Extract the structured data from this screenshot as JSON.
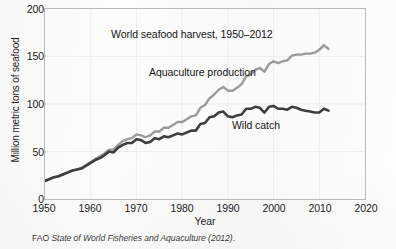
{
  "figure": {
    "title": "World seafood harvest, 1950–2012",
    "caption_prefix": "FAO ",
    "caption_italic": "State of World Fisheries and Aquaculture (2012)",
    "caption_suffix": "."
  },
  "axes": {
    "xlabel": "Year",
    "ylabel": "Million metric tons of seafood",
    "xticks": [
      "1950",
      "1960",
      "1970",
      "1980",
      "1990",
      "2000",
      "2010",
      "2020"
    ],
    "yticks": [
      "0",
      "50",
      "100",
      "150",
      "200"
    ]
  },
  "annotations": {
    "aquaculture": "Aquaculture production",
    "wild_catch": "Wild catch"
  },
  "colors": {
    "aquaculture_line": "#9a9a9a",
    "wild_catch_line": "#3d3d3d",
    "frame": "#b9b9b9",
    "grid": "#ececec",
    "page": "#fdfdfc",
    "text": "#1c1c1c"
  },
  "chart_data": {
    "type": "line",
    "title": "World seafood harvest, 1950–2012",
    "xlabel": "Year",
    "ylabel": "Million metric tons of seafood",
    "xlim": [
      1950,
      2020
    ],
    "ylim": [
      0,
      200
    ],
    "xticks": [
      1950,
      1960,
      1970,
      1980,
      1990,
      2000,
      2010,
      2020
    ],
    "yticks": [
      0,
      50,
      100,
      150,
      200
    ],
    "grid": true,
    "legend": "inline-annotations",
    "units": "million metric tons",
    "x": [
      1950,
      1951,
      1952,
      1953,
      1954,
      1955,
      1956,
      1957,
      1958,
      1959,
      1960,
      1961,
      1962,
      1963,
      1964,
      1965,
      1966,
      1967,
      1968,
      1969,
      1970,
      1971,
      1972,
      1973,
      1974,
      1975,
      1976,
      1977,
      1978,
      1979,
      1980,
      1981,
      1982,
      1983,
      1984,
      1985,
      1986,
      1987,
      1988,
      1989,
      1990,
      1991,
      1992,
      1993,
      1994,
      1995,
      1996,
      1997,
      1998,
      1999,
      2000,
      2001,
      2002,
      2003,
      2004,
      2005,
      2006,
      2007,
      2008,
      2009,
      2010,
      2011,
      2012
    ],
    "series": [
      {
        "name": "Wild catch",
        "color": "#3d3d3d",
        "values": [
          19,
          21,
          23,
          24,
          26,
          28,
          30,
          31,
          32,
          35,
          38,
          41,
          43,
          46,
          50,
          49,
          54,
          57,
          59,
          59,
          63,
          62,
          59,
          60,
          64,
          63,
          66,
          65,
          67,
          69,
          68,
          70,
          72,
          72,
          79,
          80,
          86,
          87,
          91,
          92,
          87,
          86,
          88,
          89,
          95,
          95,
          97,
          96,
          91,
          97,
          98,
          95,
          95,
          94,
          97,
          96,
          94,
          93,
          92,
          91,
          91,
          95,
          93
        ]
      },
      {
        "name": "Aquaculture production",
        "color": "#9a9a9a",
        "values": [
          19,
          21,
          23,
          24,
          26,
          28,
          30,
          31,
          33,
          36,
          39,
          42,
          45,
          48,
          52,
          52,
          57,
          61,
          63,
          64,
          68,
          67,
          65,
          67,
          71,
          71,
          75,
          75,
          78,
          81,
          81,
          84,
          87,
          88,
          96,
          99,
          106,
          110,
          115,
          118,
          114,
          114,
          117,
          121,
          129,
          131,
          136,
          138,
          134,
          142,
          145,
          143,
          145,
          146,
          151,
          152,
          152,
          153,
          153,
          154,
          157,
          162,
          158
        ]
      }
    ]
  }
}
